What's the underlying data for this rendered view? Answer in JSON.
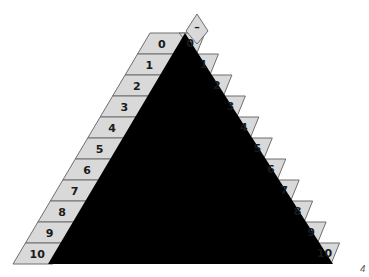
{
  "diagram": {
    "triangle_color": "#000000",
    "tab_color": "#d9d9d9",
    "top_tab_label": "–",
    "left_labels": [
      "0",
      "1",
      "2",
      "3",
      "4",
      "5",
      "6",
      "7",
      "8",
      "9",
      "10"
    ],
    "right_labels": [
      "0",
      "1",
      "2",
      "3",
      "4",
      "5",
      "6",
      "7",
      "8",
      "9",
      "10"
    ],
    "corner_label": "4"
  }
}
